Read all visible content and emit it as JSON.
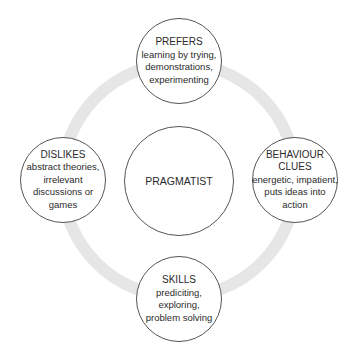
{
  "diagram": {
    "type": "cycle",
    "ring_color": "#e6e6e6",
    "center": {
      "title": "PRAGMATIST"
    },
    "nodes": {
      "top": {
        "title": "PREFERS",
        "lines": [
          "learning by trying,",
          "demonstrations,",
          "experimenting"
        ]
      },
      "right": {
        "title_lines": [
          "BEHAVIOUR",
          "CLUES"
        ],
        "lines": [
          "energetic, impatient,",
          "puts ideas into",
          "action"
        ]
      },
      "bottom": {
        "title": "SKILLS",
        "lines": [
          "prediciting,",
          "exploring,",
          "problem solving"
        ]
      },
      "left": {
        "title": "DISLIKES",
        "lines": [
          "abstract theories,",
          "irrelevant",
          "discussions or",
          "games"
        ]
      }
    }
  }
}
